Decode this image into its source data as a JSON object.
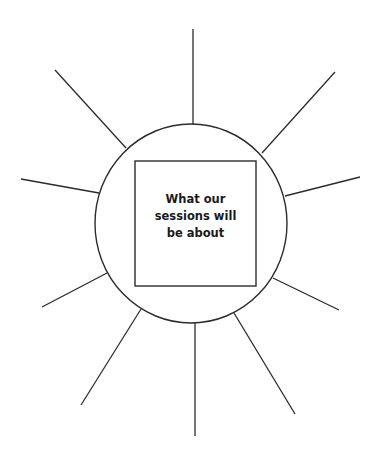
{
  "diagram": {
    "type": "sunburst-worksheet",
    "center_box": {
      "lines": [
        "What our",
        "sessions will",
        "be about"
      ]
    },
    "colors": {
      "background": "#ffffff",
      "stroke": "#2b2b2b",
      "text": "#1a1a1a"
    },
    "circle": {
      "cx": 191,
      "cy": 223.5,
      "rx": 96,
      "ry": 99.5
    },
    "box": {
      "x": 135,
      "y": 161,
      "width": 121,
      "height": 125
    },
    "rays": [
      {
        "name": "ray-top",
        "x1": 193,
        "y1": 124,
        "x2": 193,
        "y2": 29
      },
      {
        "name": "ray-upper-right",
        "x1": 262,
        "y1": 153,
        "x2": 335,
        "y2": 72
      },
      {
        "name": "ray-right",
        "x1": 285,
        "y1": 196,
        "x2": 360,
        "y2": 177
      },
      {
        "name": "ray-lower-right",
        "x1": 273,
        "y1": 278,
        "x2": 339,
        "y2": 310
      },
      {
        "name": "ray-lower-right-2",
        "x1": 234,
        "y1": 313,
        "x2": 295,
        "y2": 414
      },
      {
        "name": "ray-bottom",
        "x1": 195,
        "y1": 323,
        "x2": 195,
        "y2": 436
      },
      {
        "name": "ray-lower-left-2",
        "x1": 141,
        "y1": 309,
        "x2": 81,
        "y2": 405
      },
      {
        "name": "ray-lower-left",
        "x1": 107,
        "y1": 273,
        "x2": 42,
        "y2": 307
      },
      {
        "name": "ray-left",
        "x1": 99,
        "y1": 193,
        "x2": 21,
        "y2": 179
      },
      {
        "name": "ray-upper-left",
        "x1": 126,
        "y1": 148,
        "x2": 55,
        "y2": 70
      }
    ]
  }
}
